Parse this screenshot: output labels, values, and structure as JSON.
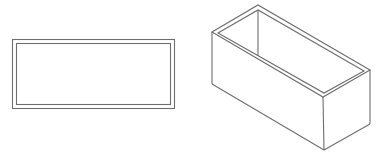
{
  "figure": {
    "line_color": "#6e6e6e",
    "background": "#ffffff",
    "views": [
      {
        "name": "top-view",
        "label": ""
      },
      {
        "name": "isometric-view",
        "label": ""
      }
    ]
  }
}
